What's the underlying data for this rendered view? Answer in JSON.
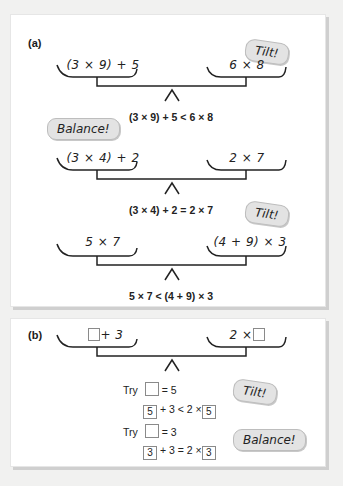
{
  "panel_a": {
    "label": "(a)",
    "balances": [
      {
        "left": "(3 × 9) + 5",
        "right": "6 × 8",
        "equation": "(3 × 9) + 5 < 6 × 8",
        "bubble": "Tilt!"
      },
      {
        "left": "(3 × 4) + 2",
        "right": "2 × 7",
        "equation": "(3 × 4) + 2 = 2 × 7",
        "bubble": "Balance!"
      },
      {
        "left": "5 × 7",
        "right": "(4 + 9) × 3",
        "equation": "5 × 7 < (4 + 9) × 3",
        "bubble": "Tilt!"
      }
    ]
  },
  "panel_b": {
    "label": "(b)",
    "left_suffix": "+ 3",
    "right_prefix": "2 ×",
    "tries": [
      {
        "try_label": "Try",
        "assign": "= 5",
        "value": "5",
        "mid": "+ 3 < 2 ×",
        "bubble": "Tilt!"
      },
      {
        "try_label": "Try",
        "assign": "= 3",
        "value": "3",
        "mid": "+ 3 = 2 ×",
        "bubble": "Balance!"
      }
    ]
  }
}
